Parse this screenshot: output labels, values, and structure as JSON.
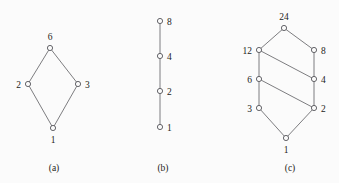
{
  "figure": {
    "background_color": "#fbfbfb",
    "line_color": "#6e6e72",
    "node_stroke_color": "#55555a",
    "node_fill_color": "#fbfbfb",
    "text_color": "#1d1d20",
    "panels": [
      {
        "id": "panel-a",
        "caption": "(a)",
        "caption_x": 54,
        "caption_y": 171,
        "nodes": [
          {
            "label": "6",
            "x": 50,
            "y": 48,
            "r": 2.6,
            "label_pos": "above",
            "lx": 50,
            "ly": 40
          },
          {
            "label": "2",
            "x": 28,
            "y": 84,
            "r": 2.6,
            "label_pos": "left",
            "lx": 21,
            "ly": 88
          },
          {
            "label": "3",
            "x": 78,
            "y": 84,
            "r": 2.6,
            "label_pos": "right",
            "lx": 85,
            "ly": 88
          },
          {
            "label": "1",
            "x": 53,
            "y": 128,
            "r": 2.6,
            "label_pos": "below",
            "lx": 53,
            "ly": 143
          }
        ],
        "edges": [
          {
            "from": "1",
            "to": "2",
            "x1": 53,
            "y1": 128,
            "x2": 28,
            "y2": 84
          },
          {
            "from": "1",
            "to": "3",
            "x1": 53,
            "y1": 128,
            "x2": 78,
            "y2": 84
          },
          {
            "from": "2",
            "to": "6",
            "x1": 28,
            "y1": 84,
            "x2": 50,
            "y2": 48
          },
          {
            "from": "3",
            "to": "6",
            "x1": 78,
            "y1": 84,
            "x2": 50,
            "y2": 48
          }
        ]
      },
      {
        "id": "panel-b",
        "caption": "(b)",
        "caption_x": 163,
        "caption_y": 171,
        "nodes": [
          {
            "label": "8",
            "x": 160,
            "y": 21,
            "r": 2.6,
            "label_pos": "right",
            "lx": 167,
            "ly": 25
          },
          {
            "label": "4",
            "x": 160,
            "y": 56,
            "r": 2.6,
            "label_pos": "right",
            "lx": 167,
            "ly": 60
          },
          {
            "label": "2",
            "x": 160,
            "y": 91,
            "r": 2.6,
            "label_pos": "right",
            "lx": 167,
            "ly": 95
          },
          {
            "label": "1",
            "x": 160,
            "y": 127,
            "r": 2.6,
            "label_pos": "right",
            "lx": 167,
            "ly": 131
          }
        ],
        "edges": [
          {
            "from": "1",
            "to": "2",
            "x1": 160,
            "y1": 127,
            "x2": 160,
            "y2": 91
          },
          {
            "from": "2",
            "to": "4",
            "x1": 160,
            "y1": 91,
            "x2": 160,
            "y2": 56
          },
          {
            "from": "4",
            "to": "8",
            "x1": 160,
            "y1": 56,
            "x2": 160,
            "y2": 21
          }
        ]
      },
      {
        "id": "panel-c",
        "caption": "(c)",
        "caption_x": 290,
        "caption_y": 171,
        "nodes": [
          {
            "label": "24",
            "x": 284,
            "y": 28,
            "r": 2.6,
            "label_pos": "above",
            "lx": 284,
            "ly": 20
          },
          {
            "label": "12",
            "x": 259,
            "y": 50,
            "r": 2.6,
            "label_pos": "left",
            "lx": 252,
            "ly": 54
          },
          {
            "label": "8",
            "x": 314,
            "y": 50,
            "r": 2.6,
            "label_pos": "right",
            "lx": 321,
            "ly": 54
          },
          {
            "label": "6",
            "x": 259,
            "y": 79,
            "r": 2.6,
            "label_pos": "left",
            "lx": 252,
            "ly": 83
          },
          {
            "label": "4",
            "x": 314,
            "y": 79,
            "r": 2.6,
            "label_pos": "right",
            "lx": 321,
            "ly": 83
          },
          {
            "label": "3",
            "x": 259,
            "y": 108,
            "r": 2.6,
            "label_pos": "left",
            "lx": 252,
            "ly": 112
          },
          {
            "label": "2",
            "x": 314,
            "y": 108,
            "r": 2.6,
            "label_pos": "right",
            "lx": 321,
            "ly": 112
          },
          {
            "label": "1",
            "x": 286,
            "y": 138,
            "r": 2.6,
            "label_pos": "below",
            "lx": 286,
            "ly": 153
          }
        ],
        "edges": [
          {
            "from": "12",
            "to": "24",
            "x1": 259,
            "y1": 50,
            "x2": 284,
            "y2": 28
          },
          {
            "from": "8",
            "to": "24",
            "x1": 314,
            "y1": 50,
            "x2": 284,
            "y2": 28
          },
          {
            "from": "12",
            "to": "6",
            "x1": 259,
            "y1": 50,
            "x2": 259,
            "y2": 79
          },
          {
            "from": "8",
            "to": "4",
            "x1": 314,
            "y1": 50,
            "x2": 314,
            "y2": 79
          },
          {
            "from": "4",
            "to": "12",
            "x1": 314,
            "y1": 79,
            "x2": 259,
            "y2": 50
          },
          {
            "from": "6",
            "to": "3",
            "x1": 259,
            "y1": 79,
            "x2": 259,
            "y2": 108
          },
          {
            "from": "4",
            "to": "2",
            "x1": 314,
            "y1": 79,
            "x2": 314,
            "y2": 108
          },
          {
            "from": "2",
            "to": "6",
            "x1": 314,
            "y1": 108,
            "x2": 259,
            "y2": 79
          },
          {
            "from": "1",
            "to": "3",
            "x1": 286,
            "y1": 138,
            "x2": 259,
            "y2": 108
          },
          {
            "from": "1",
            "to": "2",
            "x1": 286,
            "y1": 138,
            "x2": 314,
            "y2": 108
          }
        ]
      }
    ]
  }
}
